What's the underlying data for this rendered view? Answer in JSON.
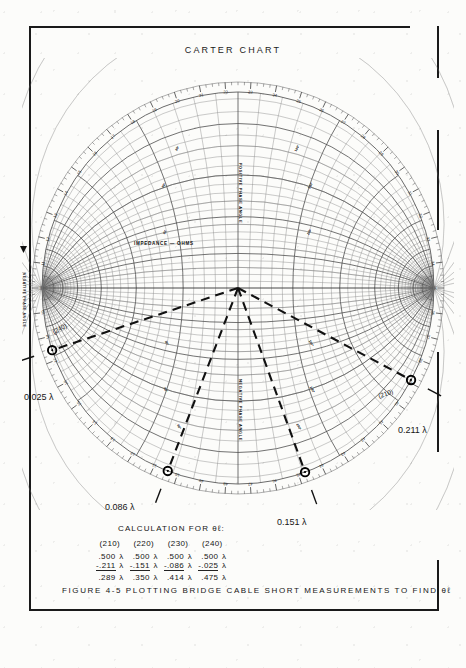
{
  "figure": {
    "chart_title": "CARTER  CHART",
    "caption": "FIGURE  4-5     PLOTTING  BRIDGE  CABLE  SHORT  MEASUREMENTS  TO  FIND  θℓ"
  },
  "chart_labels": {
    "impedance": "IMPEDANCE — OHMS",
    "positive_phase_angle": "POSITIVE PHASE ANGLE",
    "negative_phase_angle": "NEGATIVE PHASE ANGLE",
    "left_axis": "NEGATIVE PHASE ANGLE"
  },
  "plotted_points": [
    {
      "id": "pt-240",
      "tag": "(240)",
      "wavelength": "0.025 λ",
      "angle_deg": 198.5
    },
    {
      "id": "pt-210",
      "tag": "(210)",
      "wavelength": "0.211 λ",
      "angle_deg": 332.0
    },
    {
      "id": "pt-086",
      "tag": "",
      "wavelength": "0.086 λ",
      "angle_deg": 249.0
    },
    {
      "id": "pt-151",
      "tag": "",
      "wavelength": "0.151 λ",
      "angle_deg": 290.0
    }
  ],
  "calculation": {
    "title": "CALCULATION FOR θℓ:",
    "columns": [
      "(210)",
      "(220)",
      "(230)",
      "(240)"
    ],
    "rows": [
      {
        "values": [
          ".500",
          ".500",
          ".500",
          ".500"
        ],
        "underline": false
      },
      {
        "values": [
          "-.211",
          "-.151",
          "-.086",
          "-.025"
        ],
        "underline": true
      },
      {
        "values": [
          ".289",
          ".350",
          ".414",
          ".475"
        ],
        "underline": false
      }
    ],
    "unit": "λ"
  },
  "chart_data": {
    "type": "scatter",
    "title": "CARTER  CHART",
    "xlabel": "IMPEDANCE — OHMS",
    "ylabel": "PHASE ANGLE",
    "coordinate_system": "bipolar / Carter (orthogonal circles, foci at ±R on horizontal axis)",
    "outer_scale": {
      "name": "WAVELENGTHS",
      "range": [
        0.0,
        0.5
      ],
      "major_ticks": [
        "10",
        "11",
        "12",
        "13",
        "14",
        "15",
        "16",
        "17",
        "18",
        "19",
        "20",
        "21",
        "22",
        "23",
        "24",
        "25",
        "26",
        "27",
        "28",
        "29",
        "30",
        "31",
        "32",
        "33",
        "34",
        "35",
        "36",
        "37",
        "38",
        "39",
        "40",
        "41",
        "42",
        "43",
        "44",
        "45",
        "46",
        "47",
        "48",
        "49"
      ]
    },
    "angle_gridlines_deg": [
      10,
      20,
      30,
      40,
      50,
      60,
      70,
      80,
      90,
      100,
      110,
      120,
      130,
      140,
      150,
      160,
      170
    ],
    "radial_rays": [
      {
        "label": "(240)",
        "wavelength": 0.025,
        "angle_deg": 198.5
      },
      {
        "label": "",
        "wavelength": 0.086,
        "angle_deg": 249.0
      },
      {
        "label": "",
        "wavelength": 0.151,
        "angle_deg": 290.0
      },
      {
        "label": "(210)",
        "wavelength": 0.211,
        "angle_deg": 332.0
      }
    ],
    "series": [
      {
        "name": "bridge short measurements",
        "points": [
          {
            "tag": "(210)",
            "wavelength": 0.211,
            "theta_l": 0.289
          },
          {
            "tag": "(220)",
            "wavelength": 0.151,
            "theta_l": 0.35
          },
          {
            "tag": "(230)",
            "wavelength": 0.086,
            "theta_l": 0.414
          },
          {
            "tag": "(240)",
            "wavelength": 0.025,
            "theta_l": 0.475
          }
        ]
      }
    ]
  },
  "colors": {
    "ink": "#1a1a1a",
    "grid": "#7d7d7d",
    "grid_light": "#a9a9a9",
    "paper": "#fcfcfa"
  }
}
